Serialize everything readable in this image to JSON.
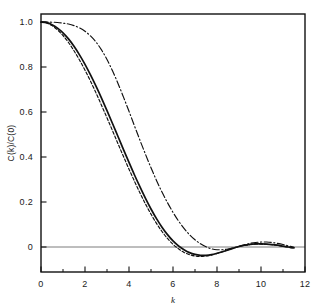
{
  "chart_data": {
    "type": "line",
    "title": "",
    "subtitle": "",
    "xlabel": "k",
    "ylabel": "C(k)/C(0)",
    "xlim": [
      0,
      12
    ],
    "ylim": [
      -0.08,
      1.04
    ],
    "grid": false,
    "legend": "none",
    "x_ticks_major": [
      0,
      2,
      4,
      6,
      8,
      10,
      12
    ],
    "x_tick_labels": [
      "0",
      "2",
      "4",
      "6",
      "8",
      "10",
      "12"
    ],
    "x_ticks_minor": [
      1,
      3,
      5,
      7,
      9,
      11
    ],
    "y_ticks_major": [
      0,
      0.2,
      0.4,
      0.6,
      0.8,
      1.0
    ],
    "y_tick_labels": [
      "0",
      "0.2",
      "0.4",
      "0.6",
      "0.8",
      "1.0"
    ],
    "zero_line": 0,
    "series": [
      {
        "name": "solid",
        "style": "solid",
        "color": "#111111",
        "x": [
          0.0,
          0.25,
          0.5,
          0.75,
          1.0,
          1.25,
          1.5,
          1.75,
          2.0,
          2.25,
          2.5,
          2.75,
          3.0,
          3.25,
          3.5,
          3.75,
          4.0,
          4.25,
          4.5,
          4.75,
          5.0,
          5.25,
          5.5,
          5.75,
          6.0,
          6.25,
          6.5,
          6.75,
          7.0,
          7.25,
          7.5,
          7.75,
          8.0,
          8.25,
          8.5,
          8.75,
          9.0,
          9.25,
          9.5,
          9.75,
          10.0,
          10.25,
          10.5,
          10.75,
          11.0,
          11.25,
          11.5
        ],
        "y": [
          1.0,
          0.997,
          0.988,
          0.973,
          0.952,
          0.925,
          0.892,
          0.854,
          0.812,
          0.765,
          0.715,
          0.662,
          0.606,
          0.549,
          0.491,
          0.433,
          0.376,
          0.32,
          0.267,
          0.216,
          0.169,
          0.126,
          0.088,
          0.055,
          0.027,
          0.005,
          -0.012,
          -0.025,
          -0.033,
          -0.037,
          -0.037,
          -0.034,
          -0.028,
          -0.021,
          -0.013,
          -0.005,
          0.002,
          0.008,
          0.012,
          0.014,
          0.014,
          0.013,
          0.011,
          0.008,
          0.004,
          0.0,
          -0.004
        ]
      },
      {
        "name": "dashed",
        "style": "dashed",
        "color": "#111111",
        "x": [
          0.0,
          0.25,
          0.5,
          0.75,
          1.0,
          1.25,
          1.5,
          1.75,
          2.0,
          2.25,
          2.5,
          2.75,
          3.0,
          3.25,
          3.5,
          3.75,
          4.0,
          4.25,
          4.5,
          4.75,
          5.0,
          5.25,
          5.5,
          5.75,
          6.0,
          6.25,
          6.5,
          6.75,
          7.0,
          7.25,
          7.5,
          7.75,
          8.0,
          8.25,
          8.5,
          8.75,
          9.0,
          9.25,
          9.5,
          9.75,
          10.0,
          10.25,
          10.5,
          10.75,
          11.0,
          11.25,
          11.5
        ],
        "y": [
          1.0,
          0.996,
          0.984,
          0.965,
          0.94,
          0.909,
          0.872,
          0.831,
          0.786,
          0.737,
          0.685,
          0.63,
          0.574,
          0.517,
          0.459,
          0.402,
          0.346,
          0.292,
          0.24,
          0.191,
          0.146,
          0.105,
          0.069,
          0.038,
          0.012,
          -0.008,
          -0.024,
          -0.034,
          -0.04,
          -0.042,
          -0.04,
          -0.036,
          -0.029,
          -0.021,
          -0.013,
          -0.005,
          0.002,
          0.007,
          0.011,
          0.013,
          0.013,
          0.012,
          0.01,
          0.007,
          0.003,
          -0.001,
          -0.005
        ]
      },
      {
        "name": "dash-dot",
        "style": "dash-dot",
        "color": "#111111",
        "x": [
          0.0,
          0.25,
          0.5,
          0.75,
          1.0,
          1.25,
          1.5,
          1.75,
          2.0,
          2.25,
          2.5,
          2.75,
          3.0,
          3.25,
          3.5,
          3.75,
          4.0,
          4.25,
          4.5,
          4.75,
          5.0,
          5.25,
          5.5,
          5.75,
          6.0,
          6.25,
          6.5,
          6.75,
          7.0,
          7.25,
          7.5,
          7.75,
          8.0,
          8.25,
          8.5,
          8.75,
          9.0,
          9.25,
          9.5,
          9.75,
          10.0,
          10.25,
          10.5,
          10.75,
          11.0,
          11.25,
          11.5
        ],
        "y": [
          1.0,
          1.0,
          0.999,
          0.998,
          0.995,
          0.991,
          0.984,
          0.974,
          0.959,
          0.938,
          0.911,
          0.876,
          0.833,
          0.783,
          0.727,
          0.666,
          0.603,
          0.538,
          0.474,
          0.412,
          0.352,
          0.296,
          0.244,
          0.197,
          0.154,
          0.116,
          0.083,
          0.055,
          0.032,
          0.014,
          0.001,
          -0.008,
          -0.012,
          -0.012,
          -0.009,
          -0.004,
          0.003,
          0.01,
          0.016,
          0.02,
          0.022,
          0.022,
          0.02,
          0.016,
          0.011,
          0.005,
          -0.001
        ]
      }
    ]
  }
}
